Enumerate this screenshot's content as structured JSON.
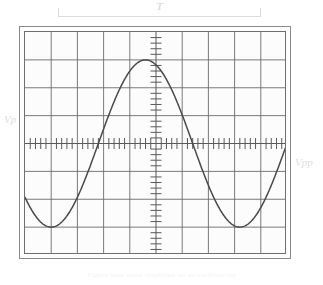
{
  "figure": {
    "kind": "oscilloscope-display",
    "caption": "Figure  Sine wave displayed on an oscilloscope"
  },
  "annotations": {
    "period_label": "T",
    "peak_label": "Vp",
    "peak_to_peak_label": "Vpp"
  },
  "colors": {
    "trace": "#4a4a4a",
    "graticule_major": "#6b6b6b",
    "graticule_minor": "#b9b9b9",
    "bezel_outer": "#8a8a8a",
    "bezel_inner": "#6f6f6f",
    "screen_background": "#fcfcfc",
    "annotation": "#dedede"
  },
  "graticule": {
    "horizontal_divisions": 10,
    "vertical_divisions": 8,
    "center_axis_ticks_per_division": 5,
    "grid_on": true
  },
  "chart_data": {
    "type": "line",
    "title": "",
    "xlabel": "",
    "ylabel": "",
    "xlim": [
      -5,
      5
    ],
    "ylim": [
      -4,
      4
    ],
    "grid": true,
    "legend": "none",
    "series": [
      {
        "name": "sine trace",
        "description": "One full cycle sine wave, amplitude 3 divisions, period 7.2 divisions, rising zero-crossing at x = -2.2 div",
        "amplitude_divisions": 3,
        "period_divisions": 7.2,
        "phase_zero_crossing_division": -2.2,
        "x": [
          -5.0,
          -4.6,
          -4.2,
          -3.8,
          -3.4,
          -3.0,
          -2.6,
          -2.2,
          -1.8,
          -1.4,
          -1.0,
          -0.6,
          -0.2,
          0.2,
          0.6,
          1.0,
          1.4,
          1.8,
          2.2,
          2.6,
          3.0,
          3.4,
          3.8,
          4.2,
          4.6,
          5.0
        ],
        "y": [
          -2.58,
          -2.17,
          -1.68,
          -1.12,
          -0.52,
          0.1,
          0.72,
          1.3,
          1.84,
          2.31,
          2.69,
          2.92,
          3.0,
          2.92,
          2.69,
          2.31,
          1.84,
          1.3,
          0.72,
          0.1,
          -0.52,
          -1.12,
          -1.68,
          -2.17,
          -2.58,
          -2.87
        ]
      }
    ],
    "annotations": [
      {
        "text": "T",
        "position": "top-bracket",
        "meaning": "period"
      },
      {
        "text": "Vp",
        "position": "left",
        "meaning": "peak voltage"
      },
      {
        "text": "Vpp",
        "position": "right",
        "meaning": "peak-to-peak voltage"
      }
    ]
  }
}
